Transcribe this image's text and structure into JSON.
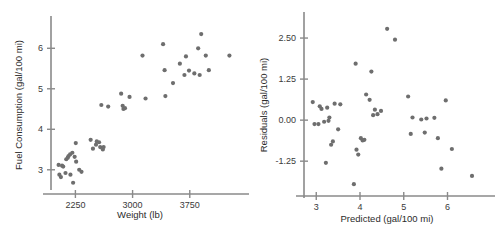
{
  "figure": {
    "kind": "two-panel-scatter",
    "background": "#ffffff",
    "point_color": "#6e6e6e",
    "axis_color": "#8a8a8a"
  },
  "chart_data": [
    {
      "type": "scatter",
      "panel": "left",
      "title": "",
      "xlabel": "Weight (lb)",
      "ylabel": "Fuel Consumption (gal/100 mi)",
      "xticks": [
        2250,
        3000,
        3750
      ],
      "xticklabels": [
        "2250",
        "3000",
        "3750"
      ],
      "yticks": [
        3,
        4,
        5,
        6
      ],
      "yticklabels": [
        "3",
        "4",
        "5",
        "6"
      ],
      "xlim": [
        1930,
        4330
      ],
      "ylim": [
        2.55,
        6.55
      ],
      "grid": false,
      "legend": null,
      "x": [
        2030,
        2040,
        2060,
        2075,
        2090,
        2120,
        2130,
        2150,
        2160,
        2180,
        2185,
        2210,
        2220,
        2240,
        2255,
        2260,
        2300,
        2330,
        2450,
        2480,
        2520,
        2530,
        2560,
        2575,
        2590,
        2610,
        2620,
        2680,
        2850,
        2870,
        2880,
        2900,
        2960,
        3130,
        3170,
        3400,
        3420,
        3430,
        3530,
        3620,
        3680,
        3700,
        3740,
        3810,
        3860,
        3880,
        3900,
        3960,
        4000,
        4270
      ],
      "y": [
        3.12,
        2.88,
        2.82,
        3.1,
        3.08,
        2.92,
        3.26,
        3.3,
        3.34,
        3.38,
        2.88,
        3.42,
        2.68,
        3.32,
        3.66,
        3.2,
        3.0,
        2.95,
        3.74,
        3.52,
        3.62,
        3.7,
        3.68,
        3.56,
        4.6,
        3.5,
        3.56,
        4.56,
        4.88,
        4.58,
        4.5,
        4.52,
        4.8,
        5.82,
        4.76,
        6.1,
        5.46,
        4.82,
        5.14,
        5.62,
        5.34,
        5.8,
        5.45,
        5.38,
        6.0,
        5.34,
        6.35,
        5.82,
        5.46,
        5.82
      ]
    },
    {
      "type": "scatter",
      "panel": "right",
      "title": "",
      "xlabel": "Predicted (gal/100 mi)",
      "ylabel": "Residuals (gal/100 mi)",
      "xticks": [
        3,
        4,
        5,
        6
      ],
      "xticklabels": [
        "3",
        "4",
        "5",
        "6"
      ],
      "yticks": [
        2.5,
        1.25,
        0.0,
        -1.25
      ],
      "yticklabels": [
        "2.50",
        "1.25",
        "0.00",
        "-1.25"
      ],
      "xlim": [
        2.72,
        6.72
      ],
      "ylim": [
        -2.25,
        3.05
      ],
      "grid": false,
      "legend": null,
      "x": [
        2.92,
        2.96,
        3.05,
        3.08,
        3.12,
        3.18,
        3.22,
        3.25,
        3.28,
        3.3,
        3.34,
        3.38,
        3.42,
        3.5,
        3.55,
        3.86,
        3.9,
        3.92,
        3.96,
        4.02,
        4.06,
        4.1,
        4.14,
        4.22,
        4.26,
        4.3,
        4.34,
        4.4,
        4.48,
        4.62,
        4.8,
        5.1,
        5.16,
        5.2,
        5.4,
        5.48,
        5.52,
        5.7,
        5.78,
        5.86,
        5.96,
        6.1,
        6.56
      ],
      "y": [
        0.55,
        -0.12,
        -0.12,
        0.42,
        0.34,
        -0.05,
        -1.3,
        0.38,
        -0.02,
        0.08,
        -0.75,
        -0.65,
        0.5,
        -0.28,
        0.48,
        -1.95,
        1.72,
        -0.9,
        -1.05,
        -0.55,
        -0.62,
        -0.6,
        0.78,
        0.62,
        1.48,
        0.15,
        0.32,
        0.18,
        0.28,
        2.78,
        2.45,
        0.72,
        -0.42,
        0.08,
        0.02,
        -0.38,
        0.05,
        0.07,
        -0.55,
        -1.48,
        0.6,
        -0.88,
        -1.7
      ]
    }
  ]
}
